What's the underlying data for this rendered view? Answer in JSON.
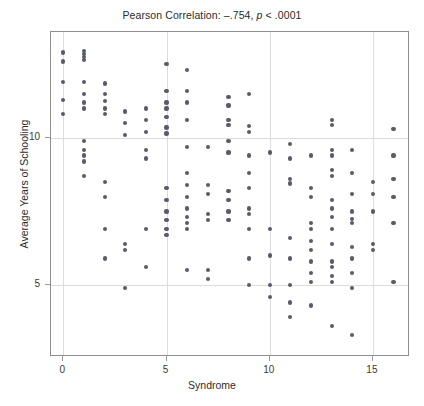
{
  "chart_data": {
    "type": "scatter",
    "title": "Pearson Correlation: –.754, p < .0001",
    "title_prefix": "Pearson Correlation: –.754, ",
    "title_italic": "p",
    "title_suffix": " < .0001",
    "xlabel": "Syndrome",
    "ylabel": "Average Years of Schooling",
    "xlim": [
      -0.6,
      16.8
    ],
    "ylim": [
      2.55,
      13.6
    ],
    "xticks": [
      0,
      5,
      10,
      15
    ],
    "xticklabels": [
      "0",
      "5",
      "10",
      "15"
    ],
    "yticks": [
      5,
      10
    ],
    "yticklabels": [
      "5",
      "10"
    ],
    "grid": true,
    "grid_x_at": [
      0,
      5,
      10,
      15
    ],
    "grid_y_at": [
      5,
      10
    ],
    "marker_color": "#595a6b",
    "frame_color": "#8e8e8e",
    "grid_color": "#dddddd",
    "correlation_r": -0.754,
    "p_value_text": "< .0001",
    "points": [
      [
        0,
        12.9
      ],
      [
        0,
        12.6
      ],
      [
        0,
        11.9
      ],
      [
        0,
        11.3
      ],
      [
        0,
        10.8
      ],
      [
        1,
        12.95
      ],
      [
        1,
        12.85
      ],
      [
        1,
        12.75
      ],
      [
        1,
        12.65
      ],
      [
        1,
        11.9
      ],
      [
        1,
        11.5
      ],
      [
        1,
        11.2
      ],
      [
        1,
        11.0
      ],
      [
        1,
        9.9
      ],
      [
        1,
        9.6
      ],
      [
        1,
        9.4
      ],
      [
        1,
        9.2
      ],
      [
        1,
        8.7
      ],
      [
        2,
        11.85
      ],
      [
        2,
        11.5
      ],
      [
        2,
        11.25
      ],
      [
        2,
        11.0
      ],
      [
        2,
        10.8
      ],
      [
        2,
        8.5
      ],
      [
        2,
        8.0
      ],
      [
        2,
        6.9
      ],
      [
        2,
        5.9
      ],
      [
        3,
        10.9
      ],
      [
        3,
        10.5
      ],
      [
        3,
        10.1
      ],
      [
        3,
        6.4
      ],
      [
        3,
        6.2
      ],
      [
        3,
        4.9
      ],
      [
        4,
        11.0
      ],
      [
        4,
        10.6
      ],
      [
        4,
        10.2
      ],
      [
        4,
        9.6
      ],
      [
        4,
        9.3
      ],
      [
        4,
        6.9
      ],
      [
        4,
        5.6
      ],
      [
        5,
        12.5
      ],
      [
        5,
        11.6
      ],
      [
        5,
        11.2
      ],
      [
        5,
        11.0
      ],
      [
        5,
        10.7
      ],
      [
        5,
        10.35
      ],
      [
        5,
        10.15
      ],
      [
        5,
        8.3
      ],
      [
        5,
        7.9
      ],
      [
        5,
        7.5
      ],
      [
        5,
        7.2
      ],
      [
        5,
        6.9
      ],
      [
        5,
        6.7
      ],
      [
        6,
        12.3
      ],
      [
        6,
        11.6
      ],
      [
        6,
        11.2
      ],
      [
        6,
        10.6
      ],
      [
        6,
        9.7
      ],
      [
        6,
        8.8
      ],
      [
        6,
        8.4
      ],
      [
        6,
        8.0
      ],
      [
        6,
        7.6
      ],
      [
        6,
        7.3
      ],
      [
        6,
        7.1
      ],
      [
        6,
        6.9
      ],
      [
        6,
        5.5
      ],
      [
        7,
        9.7
      ],
      [
        7,
        8.4
      ],
      [
        7,
        8.1
      ],
      [
        7,
        7.4
      ],
      [
        7,
        7.2
      ],
      [
        7,
        5.5
      ],
      [
        7,
        5.2
      ],
      [
        8,
        11.4
      ],
      [
        8,
        11.1
      ],
      [
        8,
        10.6
      ],
      [
        8,
        10.45
      ],
      [
        8,
        9.9
      ],
      [
        8,
        9.5
      ],
      [
        8,
        8.2
      ],
      [
        8,
        7.9
      ],
      [
        8,
        7.5
      ],
      [
        8,
        7.2
      ],
      [
        9,
        11.5
      ],
      [
        9,
        10.4
      ],
      [
        9,
        10.2
      ],
      [
        9,
        9.4
      ],
      [
        9,
        8.8
      ],
      [
        9,
        8.3
      ],
      [
        9,
        7.6
      ],
      [
        9,
        7.4
      ],
      [
        9,
        6.9
      ],
      [
        9,
        5.9
      ],
      [
        9,
        5.0
      ],
      [
        10,
        9.5
      ],
      [
        10,
        6.9
      ],
      [
        10,
        6.0
      ],
      [
        10,
        5.0
      ],
      [
        10,
        4.6
      ],
      [
        11,
        9.8
      ],
      [
        11,
        9.3
      ],
      [
        11,
        8.6
      ],
      [
        11,
        8.45
      ],
      [
        11,
        6.6
      ],
      [
        11,
        5.9
      ],
      [
        11,
        5.0
      ],
      [
        11,
        4.4
      ],
      [
        11,
        3.9
      ],
      [
        12,
        9.4
      ],
      [
        12,
        8.3
      ],
      [
        12,
        8.0
      ],
      [
        12,
        7.1
      ],
      [
        12,
        6.9
      ],
      [
        12,
        6.5
      ],
      [
        12,
        6.2
      ],
      [
        12,
        5.8
      ],
      [
        12,
        5.4
      ],
      [
        12,
        5.1
      ],
      [
        12,
        4.3
      ],
      [
        13,
        10.6
      ],
      [
        13,
        10.45
      ],
      [
        13,
        9.6
      ],
      [
        13,
        9.4
      ],
      [
        13,
        8.9
      ],
      [
        13,
        8.7
      ],
      [
        13,
        7.9
      ],
      [
        13,
        7.6
      ],
      [
        13,
        7.3
      ],
      [
        13,
        6.9
      ],
      [
        13,
        6.4
      ],
      [
        13,
        5.8
      ],
      [
        13,
        5.6
      ],
      [
        13,
        5.3
      ],
      [
        13,
        5.1
      ],
      [
        13,
        3.6
      ],
      [
        14,
        9.6
      ],
      [
        14,
        8.8
      ],
      [
        14,
        8.1
      ],
      [
        14,
        7.5
      ],
      [
        14,
        7.25
      ],
      [
        14,
        7.1
      ],
      [
        14,
        6.3
      ],
      [
        14,
        5.9
      ],
      [
        14,
        5.4
      ],
      [
        14,
        4.9
      ],
      [
        14,
        3.3
      ],
      [
        15,
        8.5
      ],
      [
        15,
        8.1
      ],
      [
        15,
        7.5
      ],
      [
        15,
        6.4
      ],
      [
        15,
        6.2
      ],
      [
        16,
        10.3
      ],
      [
        16,
        9.4
      ],
      [
        16,
        8.6
      ],
      [
        16,
        8.0
      ],
      [
        16,
        7.1
      ],
      [
        16,
        5.1
      ]
    ]
  }
}
